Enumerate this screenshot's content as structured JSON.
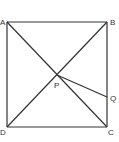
{
  "diagram": {
    "type": "geometry",
    "points": {
      "A": {
        "label": "A",
        "x": 7,
        "y": 22
      },
      "B": {
        "label": "B",
        "x": 107,
        "y": 22
      },
      "C": {
        "label": "C",
        "x": 107,
        "y": 127
      },
      "D": {
        "label": "D",
        "x": 7,
        "y": 127
      },
      "P": {
        "label": "P",
        "x": 57,
        "y": 75
      },
      "Q": {
        "label": "Q",
        "x": 107,
        "y": 97
      }
    },
    "segments": [
      "AB",
      "BC",
      "CD",
      "DA",
      "AC",
      "BD",
      "PQ"
    ],
    "stroke_color": "#333333"
  }
}
